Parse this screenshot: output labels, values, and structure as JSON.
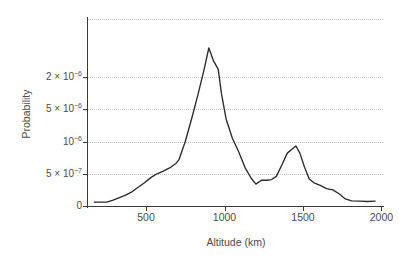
{
  "chart_data": {
    "type": "line",
    "title": "",
    "xlabel": "Altitude (km)",
    "ylabel": "Probability",
    "xlim": [
      130,
      2010
    ],
    "ylim": [
      0,
      2.9e-06
    ],
    "grid": true,
    "legend": "none",
    "series_color": "#2b2b2b",
    "x_ticks": [
      500,
      1000,
      1500,
      2000
    ],
    "x_tick_labels": [
      "500",
      "1000",
      "1500",
      "2000"
    ],
    "y_ticks": [
      0,
      5e-07,
      1e-06,
      1.5e-06,
      2e-06
    ],
    "y_tick_labels": [
      "0",
      "5 × 10−7",
      "10−6",
      "5 × 10−6",
      "2 × 10−6"
    ],
    "y_tick_label_parts": [
      {
        "mantissa": "0",
        "times": "",
        "base": "",
        "exponent": ""
      },
      {
        "mantissa": "5",
        "times": "×",
        "base": "10",
        "exponent": "−7"
      },
      {
        "mantissa": "",
        "times": "",
        "base": "10",
        "exponent": "−6"
      },
      {
        "mantissa": "5",
        "times": "×",
        "base": "10",
        "exponent": "−6"
      },
      {
        "mantissa": "2",
        "times": "×",
        "base": "10",
        "exponent": "−6"
      }
    ],
    "x": [
      170,
      210,
      250,
      290,
      330,
      370,
      410,
      450,
      490,
      530,
      570,
      610,
      650,
      690,
      710,
      750,
      790,
      830,
      870,
      900,
      930,
      960,
      980,
      1010,
      1050,
      1090,
      1130,
      1170,
      1200,
      1235,
      1270,
      1300,
      1330,
      1370,
      1400,
      1430,
      1455,
      1480,
      1510,
      1540,
      1570,
      1610,
      1650,
      1690,
      1730,
      1770,
      1810,
      1860,
      1910,
      1960
    ],
    "y": [
      6e-08,
      6e-08,
      6e-08,
      9e-08,
      1.3e-07,
      1.7e-07,
      2.2e-07,
      2.9e-07,
      3.6e-07,
      4.4e-07,
      5e-07,
      5.4e-07,
      5.9e-07,
      6.6e-07,
      7.2e-07,
      1e-06,
      1.35e-06,
      1.72e-06,
      2.12e-06,
      2.45e-06,
      2.25e-06,
      2.12e-06,
      1.75e-06,
      1.35e-06,
      1.05e-06,
      8.4e-07,
      6e-07,
      4.3e-07,
      3.4e-07,
      4e-07,
      4e-07,
      4.1e-07,
      4.6e-07,
      6.6e-07,
      8.2e-07,
      8.8e-07,
      9.3e-07,
      8.2e-07,
      6e-07,
      4.2e-07,
      3.6e-07,
      3.2e-07,
      2.7e-07,
      2.5e-07,
      1.9e-07,
      1.1e-07,
      8e-08,
      7.5e-08,
      7e-08,
      7.5e-08
    ],
    "annotations": []
  },
  "axes": {
    "y_title": "Probability",
    "x_title": "Altitude (km)"
  }
}
